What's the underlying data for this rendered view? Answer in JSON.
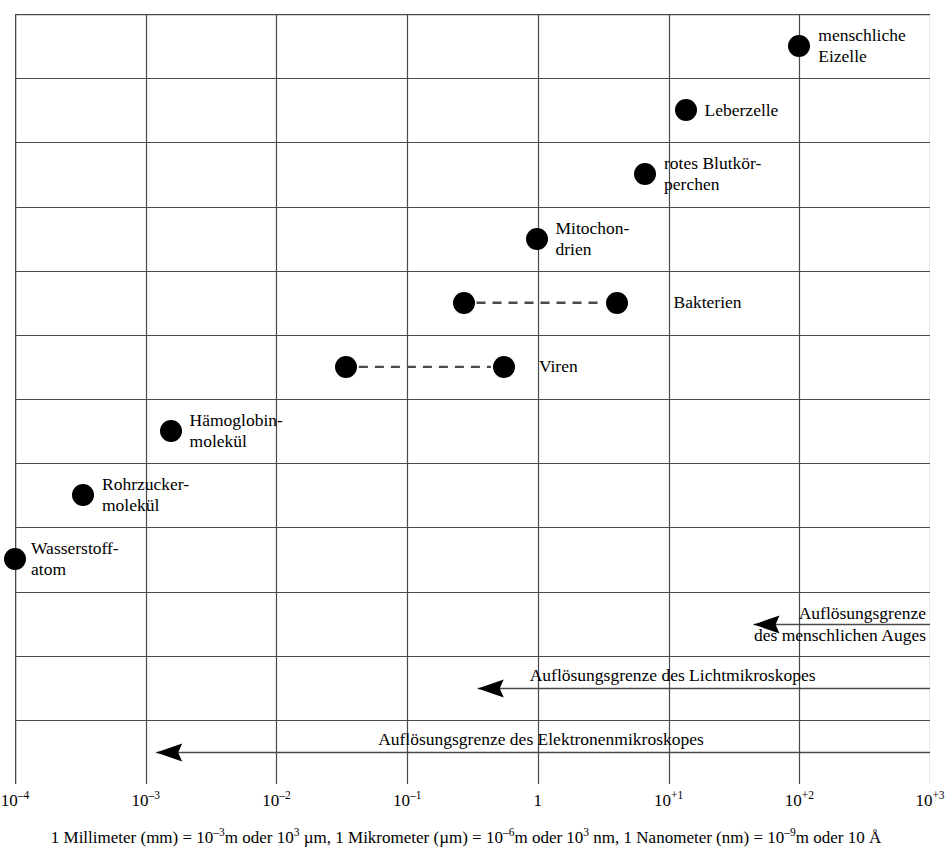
{
  "chart_data": {
    "type": "scatter",
    "title": "",
    "xlabel": "",
    "ylabel": "",
    "scale": "log10",
    "grid": true,
    "legend_position": "none",
    "xlim": [
      -4,
      3
    ],
    "x_tick_values": [
      -4,
      -3,
      -2,
      -1,
      0,
      1,
      2,
      3
    ],
    "x_tick_labels": [
      "10⁻⁴",
      "10⁻³",
      "10⁻²",
      "10⁻¹",
      "1",
      "10⁺¹",
      "10⁺²",
      "10⁺³"
    ],
    "x_unit": "µm",
    "row_count": 12,
    "points": [
      {
        "name": "menschliche Eizelle",
        "label": "menschliche\nEizelle",
        "row": 0,
        "log_x": 2.0,
        "value": 100,
        "range": null
      },
      {
        "name": "Leberzelle",
        "label": "Leberzelle",
        "row": 1,
        "log_x": 1.13,
        "value": 13.5,
        "range": null
      },
      {
        "name": "rotes Blutkörperchen",
        "label": "rotes Blutkör-\nperchen",
        "row": 2,
        "log_x": 0.82,
        "value": 6.6,
        "range": null
      },
      {
        "name": "Mitochondrien",
        "label": "Mitochon-\ndrien",
        "row": 3,
        "log_x": -0.01,
        "value": 1.0,
        "range": null
      },
      {
        "name": "Bakterien",
        "label": "Bakterien",
        "row": 4,
        "log_x": -0.57,
        "value": 0.27,
        "range": [
          0.27,
          4.0
        ]
      },
      {
        "name": "Viren",
        "label": "Viren",
        "row": 5,
        "log_x": -1.47,
        "value": 0.034,
        "range": [
          0.034,
          0.55
        ]
      },
      {
        "name": "Hämoglobinmolekül",
        "label": "Hämoglobin-\nmolekül",
        "row": 6,
        "log_x": -2.81,
        "value": 0.0015,
        "range": null
      },
      {
        "name": "Rohrzuckermolekül",
        "label": "Rohrzucker-\nmolekül",
        "row": 7,
        "log_x": -3.48,
        "value": 0.00033,
        "range": null
      },
      {
        "name": "Wasserstoffatom",
        "label": "Wasserstoff-\natom",
        "row": 8,
        "log_x": -4.0,
        "value": 0.0001,
        "range": null
      }
    ],
    "limits": [
      {
        "name": "Auflösungsgrenze des menschlichen Auges",
        "label": "Auflösungsgrenze\ndes menschlichen Auges",
        "row": 9,
        "arrow_tip_log_x": 1.65,
        "direction": "left"
      },
      {
        "name": "Auflösungsgrenze des Lichtmikroskopes",
        "label": "Auflösungsgrenze des Lichtmikroskopes",
        "row": 10,
        "arrow_tip_log_x": -0.46,
        "direction": "left"
      },
      {
        "name": "Auflösungsgrenze des Elektronenmikroskopes",
        "label": "Auflösungsgrenze des Elektronenmikroskopes",
        "row": 11,
        "arrow_tip_log_x": -2.92,
        "direction": "left"
      }
    ]
  },
  "axis": {
    "ticks": [
      {
        "base": "10",
        "exp": "–4"
      },
      {
        "base": "10",
        "exp": "–3"
      },
      {
        "base": "10",
        "exp": "–2"
      },
      {
        "base": "10",
        "exp": "–1"
      },
      {
        "base": "1",
        "exp": ""
      },
      {
        "base": "10",
        "exp": "+1"
      },
      {
        "base": "10",
        "exp": "+2"
      },
      {
        "base": "10",
        "exp": "+3"
      }
    ]
  },
  "caption": {
    "full_text": "1 Millimeter (mm) = 10–3m oder 103 µm, 1 Mikrometer (µm) = 10–6m oder 103 nm, 1 Nanometer (nm) = 10–9m oder 10 Å",
    "segments": [
      {
        "t": "1 Millimeter (mm) = 10"
      },
      {
        "t": "–3",
        "sup": true
      },
      {
        "t": "m oder 10"
      },
      {
        "t": "3",
        "sup": true
      },
      {
        "t": " µm, 1 Mikrometer (µm) = 10"
      },
      {
        "t": "–6",
        "sup": true
      },
      {
        "t": "m oder 10"
      },
      {
        "t": "3",
        "sup": true
      },
      {
        "t": " nm, 1 Nanometer (nm) = 10"
      },
      {
        "t": "–9",
        "sup": true
      },
      {
        "t": "m oder 10 Å"
      }
    ]
  },
  "style": {
    "grid_color": "#4a4a4a",
    "dot_color": "#000000",
    "text_color": "#000000",
    "background": "#ffffff"
  }
}
